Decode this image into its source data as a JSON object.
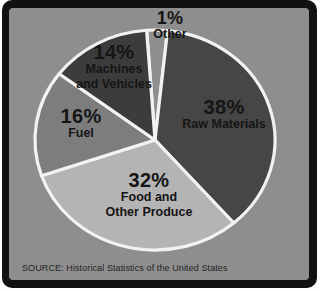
{
  "chart_data": {
    "type": "pie",
    "title": "",
    "slices": [
      {
        "name": "Other",
        "value": 1,
        "label": "1%",
        "name_lines": [
          "Other"
        ],
        "color": "#8f8f8f"
      },
      {
        "name": "Raw Materials",
        "value": 38,
        "label": "38%",
        "name_lines": [
          "Raw Materials"
        ],
        "color": "#464646"
      },
      {
        "name": "Food and Other Produce",
        "value": 32,
        "label": "32%",
        "name_lines": [
          "Food and",
          "Other Produce"
        ],
        "color": "#b4b4b4"
      },
      {
        "name": "Fuel",
        "value": 16,
        "label": "16%",
        "name_lines": [
          "Fuel"
        ],
        "color": "#7d7d7d"
      },
      {
        "name": "Machines and Vehicles",
        "value": 14,
        "label": "14%",
        "name_lines": [
          "Machines",
          "and Vehicles"
        ],
        "color": "#3c3c3c"
      }
    ],
    "label_position": "inside",
    "legend": "none",
    "start_angle_deg": -4,
    "min_slice_angle_deg": 10,
    "source": "SOURCE: Historical Statistics of the United States",
    "colors": {
      "panel_background": "#8e8e8e",
      "frame": "#111111",
      "page": "#fdfdfc",
      "separator": "#f2f2f2",
      "text": "#151515"
    }
  }
}
